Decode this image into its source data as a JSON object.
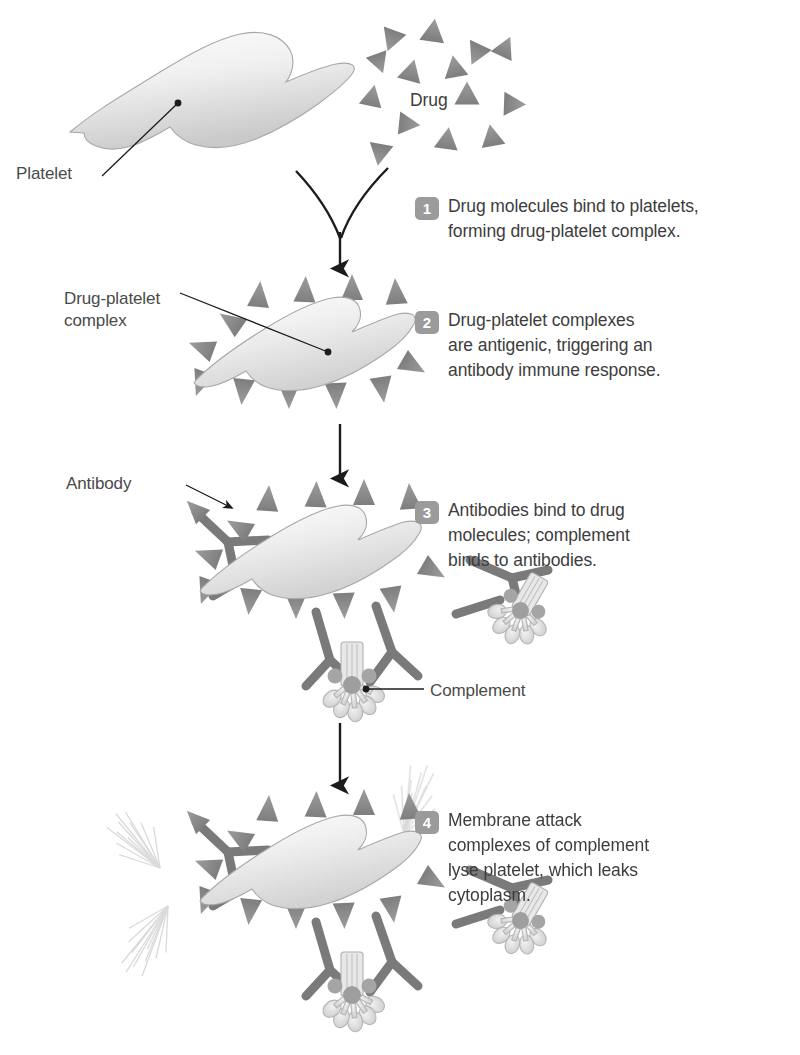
{
  "figure": {
    "title_implicit": "Drug-induced immune thrombocytopenia",
    "background_color": "#ffffff",
    "ink_color": "#3a3a3a",
    "badge_color": "#9b9b9b",
    "badge_text_color": "#ffffff",
    "drug_triangle_color": "#8e8e8e",
    "antibody_color": "#7d7d7d",
    "complement_color": "#cfcfcf",
    "platelet_fill_light": "#fbfbfb",
    "platelet_fill_dark": "#d2d2d2",
    "cytoplasm_color": "#e2e2e2"
  },
  "labels": {
    "platelet": "Platelet",
    "drug": "Drug",
    "drug_platelet_complex": "Drug-platelet\ncomplex",
    "antibody": "Antibody",
    "complement": "Complement"
  },
  "steps": [
    {
      "number": "1",
      "text": "Drug molecules bind to platelets,\nforming drug-platelet complex."
    },
    {
      "number": "2",
      "text": "Drug-platelet complexes\nare antigenic, triggering an\nantibody immune response."
    },
    {
      "number": "3",
      "text": "Antibodies bind to drug\nmolecules; complement\nbinds to antibodies."
    },
    {
      "number": "4",
      "text": "Membrane attack\ncomplexes of complement\nlyse platelet, which leaks\ncytoplasm."
    }
  ],
  "icons": {
    "drug_molecule": "triangle-icon",
    "antibody": "y-shape-icon",
    "complement": "membrane-attack-complex-icon",
    "flow_arrow": "down-arrow-icon",
    "converging_arrow": "converging-arrow-icon",
    "leader_line": "leader-line-icon",
    "cytoplasm_leak": "spray-icon"
  },
  "drug_molecules": [
    {
      "x": 392,
      "y": 39,
      "r": 200,
      "s": 1.0
    },
    {
      "x": 433,
      "y": 32,
      "r": 8,
      "s": 1.05
    },
    {
      "x": 379,
      "y": 62,
      "r": 160,
      "s": 0.92
    },
    {
      "x": 477,
      "y": 53,
      "r": 205,
      "s": 1.0
    },
    {
      "x": 505,
      "y": 48,
      "r": 25,
      "s": 0.95
    },
    {
      "x": 411,
      "y": 72,
      "r": 15,
      "s": 1.0
    },
    {
      "x": 455,
      "y": 68,
      "r": 350,
      "s": 1.0
    },
    {
      "x": 372,
      "y": 97,
      "r": 12,
      "s": 0.95
    },
    {
      "x": 467,
      "y": 95,
      "r": 0,
      "s": 1.05
    },
    {
      "x": 513,
      "y": 104,
      "r": 92,
      "s": 1.0
    },
    {
      "x": 408,
      "y": 124,
      "r": 96,
      "s": 0.95
    },
    {
      "x": 447,
      "y": 140,
      "r": 8,
      "s": 1.0
    },
    {
      "x": 492,
      "y": 137,
      "r": 350,
      "s": 1.0
    },
    {
      "x": 380,
      "y": 153,
      "r": 190,
      "s": 1.0
    }
  ],
  "arrows": [
    {
      "name": "converging-arrow",
      "from_step": 1
    },
    {
      "name": "flow-arrow-2-3",
      "x": 340,
      "y1": 424,
      "y2": 478
    },
    {
      "name": "flow-arrow-3-4",
      "x": 340,
      "y1": 723,
      "y2": 785
    }
  ],
  "step_positions": [
    {
      "left": 415,
      "top": 194
    },
    {
      "left": 415,
      "top": 308
    },
    {
      "left": 415,
      "top": 498
    },
    {
      "left": 415,
      "top": 808
    }
  ],
  "callout_positions": {
    "platelet": {
      "left": 16,
      "top": 163
    },
    "drug": {
      "left": 410,
      "top": 90
    },
    "complex": {
      "left": 64,
      "top": 288
    },
    "antibody": {
      "left": 66,
      "top": 473
    },
    "complement": {
      "left": 430,
      "top": 680
    }
  }
}
